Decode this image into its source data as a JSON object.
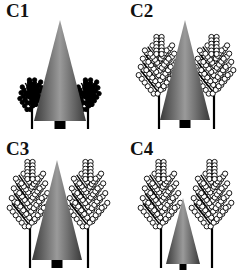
{
  "figure": {
    "panels": [
      {
        "id": "C1",
        "label": "C1",
        "conifer": {
          "apex_x": 60,
          "apex_y": 20,
          "base_y": 121,
          "half_width": 26,
          "trunk_w": 11,
          "trunk_h": 8
        },
        "deciduous": {
          "size": "small",
          "style": "bushy",
          "left_x": 32,
          "right_x": 88,
          "top_y": 78,
          "base_y": 129
        }
      },
      {
        "id": "C2",
        "label": "C2",
        "conifer": {
          "apex_x": 61,
          "apex_y": 20,
          "base_y": 120,
          "half_width": 25,
          "trunk_w": 11,
          "trunk_h": 8
        },
        "deciduous": {
          "size": "large",
          "style": "leafy",
          "left_x": 35,
          "right_x": 90,
          "top_y": 35,
          "base_y": 129
        }
      },
      {
        "id": "C3",
        "label": "C3",
        "conifer": {
          "apex_x": 57,
          "apex_y": 22,
          "base_y": 122,
          "half_width": 25,
          "trunk_w": 11,
          "trunk_h": 8
        },
        "deciduous": {
          "size": "large",
          "style": "leafy",
          "left_x": 30,
          "right_x": 88,
          "top_y": 22,
          "base_y": 130
        }
      },
      {
        "id": "C4",
        "label": "C4",
        "conifer": {
          "apex_x": 59,
          "apex_y": 60,
          "base_y": 126,
          "half_width": 17,
          "trunk_w": 7,
          "trunk_h": 6
        },
        "deciduous": {
          "size": "large",
          "style": "leafy",
          "left_x": 37,
          "right_x": 88,
          "top_y": 22,
          "base_y": 130
        }
      }
    ],
    "colors": {
      "conifer_dark": "#3a3a3a",
      "conifer_light": "#9a9a9a",
      "trunk": "#000000",
      "tree_line": "#000000",
      "leaf_fill": "#ffffff",
      "background": "#ffffff"
    }
  }
}
